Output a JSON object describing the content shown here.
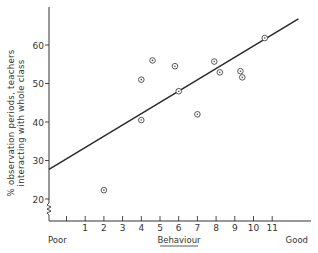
{
  "chart_data": {
    "type": "scatter",
    "title": "",
    "xlabel": "Behaviour",
    "xlabel_left": "Poor",
    "xlabel_right": "Good",
    "ylabel_line1": "% observation periods, teachers",
    "ylabel_line2": "interacting with whole class",
    "x_ticks": [
      0,
      1,
      2,
      3,
      4,
      5,
      6,
      7,
      8,
      9,
      10,
      11
    ],
    "x_tick_labels": [
      "",
      "1",
      "2",
      "3",
      "4",
      "5",
      "6",
      "7",
      "8",
      "9",
      "10",
      "11"
    ],
    "y_ticks": [
      20,
      30,
      40,
      50,
      60
    ],
    "y_tick_labels": [
      "20",
      "30",
      "40",
      "50",
      "60"
    ],
    "xlim": [
      -1,
      12.5
    ],
    "ylim": [
      15,
      70
    ],
    "y_axis_break": true,
    "grid": false,
    "points": [
      {
        "x": 2.0,
        "y": 22.3
      },
      {
        "x": 4.0,
        "y": 40.5
      },
      {
        "x": 4.0,
        "y": 51.0
      },
      {
        "x": 4.6,
        "y": 56.0
      },
      {
        "x": 5.8,
        "y": 54.5
      },
      {
        "x": 6.0,
        "y": 48.0
      },
      {
        "x": 7.0,
        "y": 42.0
      },
      {
        "x": 7.9,
        "y": 55.7
      },
      {
        "x": 8.2,
        "y": 52.9
      },
      {
        "x": 9.3,
        "y": 53.2
      },
      {
        "x": 9.4,
        "y": 51.6
      },
      {
        "x": 10.6,
        "y": 61.8
      }
    ],
    "regression_line": {
      "x0": -1,
      "y0": 27.7,
      "x1": 12.4,
      "y1": 66.8
    }
  }
}
